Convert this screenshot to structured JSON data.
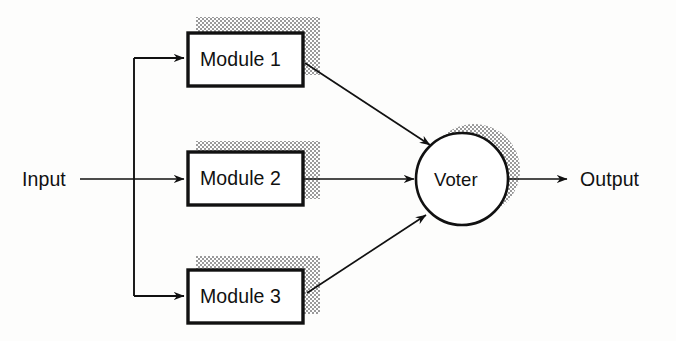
{
  "diagram": {
    "background_color": "#fdfdfc",
    "line_color": "#111111",
    "shadow_color": "#b8b8b8",
    "box_fill": "#ffffff",
    "input": {
      "label": "Input"
    },
    "output": {
      "label": "Output"
    },
    "voter": {
      "label": "Voter",
      "shape": "circle",
      "cx": 462,
      "cy": 179,
      "r": 46
    },
    "modules": [
      {
        "label": "Module 1",
        "x": 188,
        "y": 33,
        "width": 115,
        "height": 53
      },
      {
        "label": "Module 2",
        "x": 188,
        "y": 152,
        "width": 115,
        "height": 53
      },
      {
        "label": "Module 3",
        "x": 188,
        "y": 270,
        "width": 115,
        "height": 53
      }
    ],
    "connections": [
      {
        "from": "Input",
        "to": "Module 1",
        "style": "orthogonal-arrow"
      },
      {
        "from": "Input",
        "to": "Module 2",
        "style": "straight-arrow"
      },
      {
        "from": "Input",
        "to": "Module 3",
        "style": "orthogonal-arrow"
      },
      {
        "from": "Module 1",
        "to": "Voter",
        "style": "diagonal-arrow"
      },
      {
        "from": "Module 2",
        "to": "Voter",
        "style": "straight-arrow"
      },
      {
        "from": "Module 3",
        "to": "Voter",
        "style": "diagonal-arrow"
      },
      {
        "from": "Voter",
        "to": "Output",
        "style": "straight-arrow"
      }
    ]
  }
}
